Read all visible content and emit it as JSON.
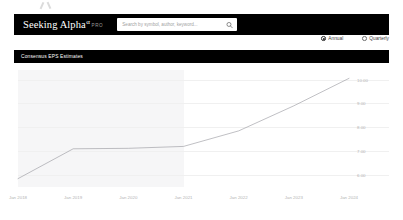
{
  "header": {
    "logo_main": "Seeking Alpha",
    "logo_alpha": "α",
    "logo_pro": "PRO",
    "search_placeholder": "Search by symbol, author, keyword...",
    "search_value": "",
    "search_icon": "search-icon"
  },
  "period_selector": {
    "options": [
      {
        "label": "Annual",
        "selected": true
      },
      {
        "label": "Quarterly",
        "selected": false
      }
    ]
  },
  "section": {
    "title": "Consensus EPS Estimates"
  },
  "colors": {
    "navbar_bg": "#000000",
    "section_bar_bg": "#000000",
    "page_bg": "#ffffff",
    "line_color": "#8c8c92",
    "shade_bg": "#f6f6f7",
    "gridline": "#f0f0f0",
    "tick_text": "#b4b4b4"
  },
  "chart_data": {
    "type": "line",
    "title": "Consensus EPS Estimates",
    "xlabel": "",
    "ylabel": "",
    "grid": true,
    "legend": "none",
    "ylim": [
      5.5,
      10.4
    ],
    "ytick_labels": [
      "10.00",
      "9.00",
      "8.00",
      "7.00",
      "6.00"
    ],
    "ytick_values": [
      10.0,
      9.0,
      8.0,
      7.0,
      6.0
    ],
    "xtick_labels": [
      "Jan 2018",
      "Jan 2019",
      "Jan 2020",
      "Jan 2021",
      "Jan 2022",
      "Jan 2023",
      "Jan 2024"
    ],
    "x": [
      "Jan 2018",
      "Jan 2019",
      "Jan 2020",
      "Jan 2021",
      "Jan 2022",
      "Jan 2023",
      "Jan 2024"
    ],
    "series": [
      {
        "name": "Consensus EPS Estimates",
        "values": [
          5.85,
          7.1,
          7.12,
          7.2,
          7.85,
          8.9,
          10.05
        ]
      }
    ],
    "actual_estimate_split": "Jan 2021",
    "shaded_region": {
      "from": "Jan 2018",
      "to": "Jan 2021",
      "meaning": "actual"
    }
  }
}
